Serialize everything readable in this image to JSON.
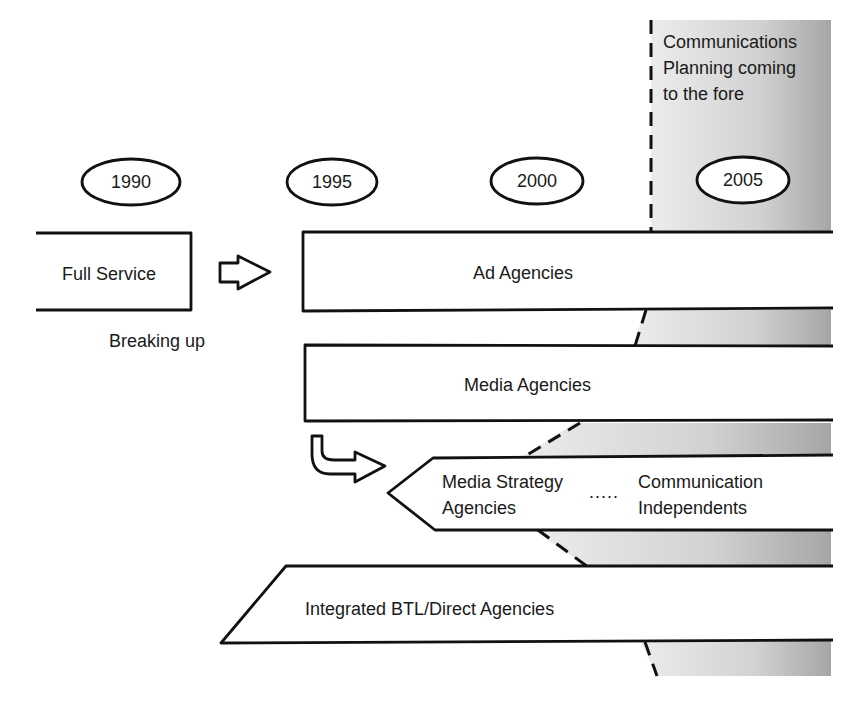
{
  "annotation": {
    "line1": "Communications",
    "line2": "Planning coming",
    "line3": "to the fore"
  },
  "years": [
    "1990",
    "1995",
    "2000",
    "2005"
  ],
  "boxes": {
    "full_service": "Full Service",
    "ad_agencies": "Ad Agencies",
    "media_agencies": "Media Agencies",
    "media_strategy_line1": "Media Strategy",
    "media_strategy_line2": "Agencies",
    "comm_ind_line1": "Communication",
    "comm_ind_line2": "Independents",
    "dots": ".....",
    "integrated": "Integrated BTL/Direct Agencies"
  },
  "captions": {
    "breaking_up": "Breaking up"
  },
  "colors": {
    "shade_light": "#e8e8e8",
    "shade_dark": "#a8a8a8",
    "stroke": "#111111"
  }
}
